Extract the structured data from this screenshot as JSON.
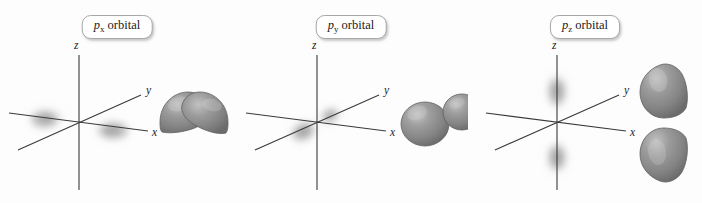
{
  "figure": {
    "background_color": "#fdfdfd",
    "panel_count": 3
  },
  "style": {
    "axis_color": "#3a3a3a",
    "lobe_fill": "#8a8a8a",
    "lobe_fill_light": "#b4b4b4",
    "lobe_fill_dark": "#6e6e6e",
    "lobe_outline": "#5f5f5f",
    "cloud_color": "#7d7d7d",
    "chip_border_color": "#a8a8a8",
    "chip_background": "#ffffff",
    "text_color": "#1a1a1a"
  },
  "panels": [
    {
      "id": "px",
      "label": {
        "symbol": "p",
        "subscript": "x",
        "word": "orbital",
        "full_text": "px orbital"
      },
      "axes": {
        "z_label": "z",
        "y_label": "y",
        "x_label": "x"
      },
      "cloud": {
        "name": "electron-density-cloud",
        "orientation": "along-x-axis",
        "blob_count": 2,
        "description": "two diffuse lobes left and right along the x axis"
      },
      "lobes": {
        "name": "px-orbital-lobes",
        "shape": "teardrop",
        "orientation": "horizontal",
        "count": 2,
        "description": "two teardrop lobes pointing toward each other along x"
      }
    },
    {
      "id": "py",
      "label": {
        "symbol": "p",
        "subscript": "y",
        "word": "orbital",
        "full_text": "py orbital"
      },
      "axes": {
        "z_label": "z",
        "y_label": "y",
        "x_label": "x"
      },
      "cloud": {
        "name": "electron-density-cloud",
        "orientation": "along-y-axis",
        "blob_count": 2,
        "description": "two diffuse lobes foreshortened along the y axis near the origin"
      },
      "lobes": {
        "name": "py-orbital-lobes",
        "shape": "rounded-sphere",
        "orientation": "horizontal-foreshortened",
        "count": 2,
        "description": "two rounded lobes viewed nearly end-on along y"
      }
    },
    {
      "id": "pz",
      "label": {
        "symbol": "p",
        "subscript": "z",
        "word": "orbital",
        "full_text": "pz orbital"
      },
      "axes": {
        "z_label": "z",
        "y_label": "y",
        "x_label": "x"
      },
      "cloud": {
        "name": "electron-density-cloud",
        "orientation": "along-z-axis",
        "blob_count": 2,
        "description": "two diffuse lobes above and below the origin along the z axis"
      },
      "lobes": {
        "name": "pz-orbital-lobes",
        "shape": "teardrop",
        "orientation": "vertical",
        "count": 2,
        "description": "two teardrop lobes stacked vertically pointing toward each other along z"
      }
    }
  ]
}
